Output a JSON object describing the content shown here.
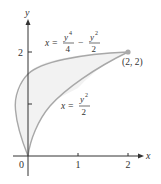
{
  "diagram": {
    "axes": {
      "x_label": "x",
      "y_label": "y",
      "origin_label": "0",
      "x_ticks": [
        "1",
        "2"
      ],
      "y_ticks": [
        "1",
        "2"
      ],
      "y_tick_labels_shown": [
        "2"
      ]
    },
    "curves": [
      {
        "name": "quartic",
        "equation": "x = y^4/4 - y^2/2",
        "label_lhs": "x =",
        "label_num1": "y",
        "label_exp1": "4",
        "label_den1": "4",
        "label_op": "−",
        "label_num2": "y",
        "label_exp2": "2",
        "label_den2": "2"
      },
      {
        "name": "parabola",
        "equation": "x = y^2/2",
        "label_lhs": "x =",
        "label_num": "y",
        "label_exp": "2",
        "label_den": "2"
      }
    ],
    "point": {
      "label": "(2, 2)",
      "x": 2,
      "y": 2
    },
    "colors": {
      "curve": "#a8a8a8",
      "fill": "#f2f2f2",
      "axis": "#333333",
      "point": "#aaaaaa"
    }
  }
}
